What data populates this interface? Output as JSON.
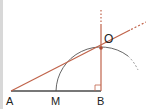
{
  "diagram": {
    "type": "geometry-construction",
    "colors": {
      "construction_line": "#c0634a",
      "base_segment": "#4a4a4a",
      "arc": "#555555",
      "label": "#222222",
      "left_border": "#d8d8d8"
    },
    "points": [
      {
        "id": "A",
        "label": "A",
        "x": 11,
        "y": 91
      },
      {
        "id": "M",
        "label": "M",
        "x": 56,
        "y": 91
      },
      {
        "id": "B",
        "label": "B",
        "x": 101,
        "y": 91
      },
      {
        "id": "O",
        "label": "O",
        "x": 101,
        "y": 48
      }
    ],
    "segments": [
      {
        "from": "A",
        "to": "B",
        "style": "solid",
        "color_key": "base_segment"
      },
      {
        "from": "B",
        "to": "O",
        "style": "solid",
        "color_key": "construction_line",
        "note": "perpendicular at B, extends upward dashed"
      },
      {
        "from": "A",
        "to": "O",
        "style": "solid",
        "color_key": "construction_line",
        "note": "ray extends beyond O, dashed"
      }
    ],
    "arc": {
      "center": "M",
      "radius": 45,
      "style": "solid then dashed"
    },
    "right_angle_at": "B"
  },
  "labels": {
    "A": "A",
    "M": "M",
    "B": "B",
    "O": "O"
  }
}
